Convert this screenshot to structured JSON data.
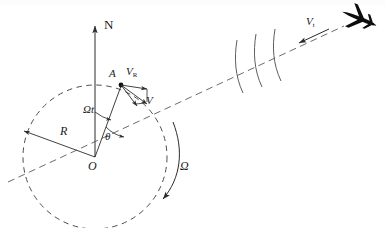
{
  "figure": {
    "labels": {
      "north": "N",
      "radius": "R",
      "origin": "O",
      "point_a": "A",
      "v_relative": "V",
      "v_relative_sub": "R",
      "v_total": "V",
      "v_target": "V",
      "v_target_sub": "t",
      "angle_omega_t": "Ωt",
      "angle_theta": "θ",
      "rotation": "Ω"
    },
    "colors": {
      "line": "#2b2b2b",
      "dashed": "#555555",
      "aircraft": "#0d0d0d",
      "background": "#ffffff"
    },
    "elements": {
      "north_arrow": "north-arrow",
      "dashed_circle": "earth-circle",
      "radius_arrow": "radius-arrow",
      "point_marker": "point-a-marker",
      "rotation_arrow": "rotation-arrow",
      "line_of_sight": "line-of-sight-dashed",
      "wave_fronts": "wave-front-arcs",
      "aircraft": "aircraft-icon",
      "velocity_vectors": "velocity-vector-group"
    },
    "geometry": {
      "circle_center": [
        95,
        157
      ],
      "circle_radius": 72,
      "point_a": [
        121,
        85
      ],
      "aircraft_position": [
        358,
        18
      ],
      "wave_arc_count": 3
    }
  }
}
